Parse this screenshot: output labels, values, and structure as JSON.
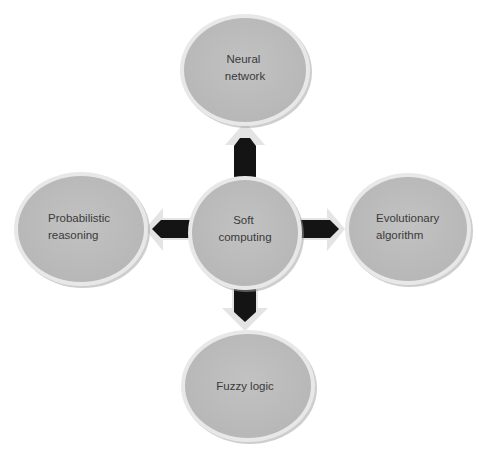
{
  "diagram": {
    "center": {
      "id": "soft-computing",
      "lines": [
        "Soft",
        "computing"
      ]
    },
    "nodes": [
      {
        "id": "neural-network",
        "position": "top",
        "lines": [
          "Neural",
          "network"
        ]
      },
      {
        "id": "probabilistic-reasoning",
        "position": "left",
        "lines": [
          "Probabilistic",
          "reasoning"
        ]
      },
      {
        "id": "evolutionary-algorithm",
        "position": "right",
        "lines": [
          "Evolutionary",
          "algorithm"
        ]
      },
      {
        "id": "fuzzy-logic",
        "position": "bottom",
        "lines": [
          "Fuzzy logic"
        ]
      }
    ],
    "edges": [
      {
        "from": "soft-computing",
        "to": "neural-network",
        "direction": "up"
      },
      {
        "from": "soft-computing",
        "to": "probabilistic-reasoning",
        "direction": "left"
      },
      {
        "from": "soft-computing",
        "to": "evolutionary-algorithm",
        "direction": "right"
      },
      {
        "from": "soft-computing",
        "to": "fuzzy-logic",
        "direction": "down"
      }
    ],
    "colors": {
      "node_fill": "#bdbdbd",
      "node_rim": "#e6e6e6",
      "node_shadow": "#9a9a9a",
      "arrow_inner": "#141414",
      "arrow_outer": "#e4e4e4",
      "text": "#3a3a3a"
    }
  }
}
